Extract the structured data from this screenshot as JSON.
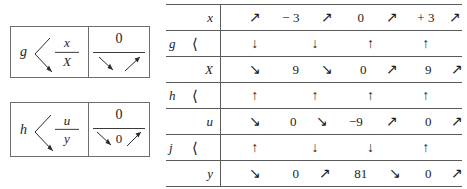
{
  "figure": {
    "kind": "variation-table-figure",
    "ink_color": "#1c1c1c",
    "rule_color": "#5a5a5a"
  },
  "left_diagrams": [
    {
      "id": "box-g",
      "function": "g",
      "bracket": "branch",
      "numerator": "x",
      "denominator": "X",
      "right_value": "0",
      "right_mid_value": "",
      "arrows": [
        "down-right",
        "up-right"
      ]
    },
    {
      "id": "box-h",
      "function": "h",
      "bracket": "branch",
      "numerator": "u",
      "denominator": "y",
      "right_value": "0",
      "right_mid_value": "0",
      "arrows": [
        "down-right",
        "up-right"
      ]
    }
  ],
  "table": {
    "rows": [
      {
        "kind": "variable",
        "label": "x",
        "fn": "",
        "bracket": "",
        "tokens": [
          {
            "type": "arrow",
            "glyph": "↗",
            "x": 14
          },
          {
            "type": "number",
            "text": "− 3",
            "x": 29
          },
          {
            "type": "arrow",
            "glyph": "↗",
            "x": 44
          },
          {
            "type": "number",
            "text": "0",
            "x": 58
          },
          {
            "type": "arrow",
            "glyph": "↗",
            "x": 71
          },
          {
            "type": "number",
            "text": "+ 3",
            "x": 85
          },
          {
            "type": "arrow",
            "glyph": "↗",
            "x": 97
          }
        ]
      },
      {
        "kind": "function",
        "label": "",
        "fn": "g",
        "bracket": "⟨",
        "tokens": [
          {
            "type": "arrow",
            "glyph": "↓",
            "x": 14
          },
          {
            "type": "arrow",
            "glyph": "↓",
            "x": 39
          },
          {
            "type": "arrow",
            "glyph": "↑",
            "x": 62
          },
          {
            "type": "arrow",
            "glyph": "↑",
            "x": 85
          }
        ]
      },
      {
        "kind": "variable",
        "label": "X",
        "fn": "",
        "bracket": "",
        "tokens": [
          {
            "type": "arrow",
            "glyph": "↘",
            "x": 14
          },
          {
            "type": "number",
            "text": "9",
            "x": 31
          },
          {
            "type": "arrow",
            "glyph": "↘",
            "x": 44
          },
          {
            "type": "number",
            "text": "0",
            "x": 59
          },
          {
            "type": "arrow",
            "glyph": "↗",
            "x": 71
          },
          {
            "type": "number",
            "text": "9",
            "x": 86
          },
          {
            "type": "arrow",
            "glyph": "↗",
            "x": 98
          }
        ]
      },
      {
        "kind": "function",
        "label": "",
        "fn": "h",
        "bracket": "⟨",
        "tokens": [
          {
            "type": "arrow",
            "glyph": "↑",
            "x": 14
          },
          {
            "type": "arrow",
            "glyph": "↑",
            "x": 39
          },
          {
            "type": "arrow",
            "glyph": "↑",
            "x": 62
          },
          {
            "type": "arrow",
            "glyph": "↑",
            "x": 85
          }
        ]
      },
      {
        "kind": "variable",
        "label": "u",
        "fn": "",
        "bracket": "",
        "tokens": [
          {
            "type": "arrow",
            "glyph": "↘",
            "x": 14
          },
          {
            "type": "number",
            "text": "0",
            "x": 30
          },
          {
            "type": "arrow",
            "glyph": "↘",
            "x": 42
          },
          {
            "type": "number",
            "text": "−9",
            "x": 56
          },
          {
            "type": "arrow",
            "glyph": "↗",
            "x": 71
          },
          {
            "type": "number",
            "text": "0",
            "x": 86
          },
          {
            "type": "arrow",
            "glyph": "↗",
            "x": 98
          }
        ]
      },
      {
        "kind": "function",
        "label": "",
        "fn": "j",
        "bracket": "⟨",
        "tokens": [
          {
            "type": "arrow",
            "glyph": "↑",
            "x": 14
          },
          {
            "type": "arrow",
            "glyph": "↓",
            "x": 39
          },
          {
            "type": "arrow",
            "glyph": "↓",
            "x": 62
          },
          {
            "type": "arrow",
            "glyph": "↑",
            "x": 85
          }
        ]
      },
      {
        "kind": "variable",
        "label": "y",
        "fn": "",
        "bracket": "",
        "tokens": [
          {
            "type": "arrow",
            "glyph": "↘",
            "x": 14
          },
          {
            "type": "number",
            "text": "0",
            "x": 31
          },
          {
            "type": "arrow",
            "glyph": "↗",
            "x": 43
          },
          {
            "type": "number",
            "text": "81",
            "x": 58
          },
          {
            "type": "arrow",
            "glyph": "↘",
            "x": 72
          },
          {
            "type": "number",
            "text": "0",
            "x": 86
          },
          {
            "type": "arrow",
            "glyph": "↗",
            "x": 98
          }
        ]
      }
    ]
  }
}
